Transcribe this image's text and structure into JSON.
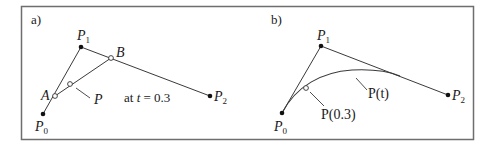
{
  "figure": {
    "frame": {
      "x": 21,
      "y": 6,
      "w": 452,
      "h": 133,
      "stroke": "#6e6e6e"
    },
    "line_color": "#3a3a3a",
    "panels": [
      {
        "id": "a",
        "label": "a)",
        "label_pos": [
          31,
          24
        ],
        "points": {
          "P0": {
            "x": 43,
            "y": 114,
            "label": "P",
            "sub": "0",
            "label_pos": [
              35,
              131
            ],
            "style": "filled"
          },
          "P1": {
            "x": 81,
            "y": 47,
            "label": "P",
            "sub": "1",
            "label_pos": [
              77,
              40
            ],
            "style": "filled"
          },
          "P2": {
            "x": 210,
            "y": 96,
            "label": "P",
            "sub": "2",
            "label_pos": [
              214,
              101
            ],
            "style": "filled"
          },
          "A": {
            "x": 55,
            "y": 96,
            "label": "A",
            "label_pos": [
              41,
              100
            ],
            "style": "open"
          },
          "B": {
            "x": 111,
            "y": 58,
            "label": "B",
            "label_pos": [
              116,
              57
            ],
            "style": "open"
          },
          "P": {
            "x": 70,
            "y": 84,
            "label": "P",
            "label_pos": [
              94,
              104
            ],
            "style": "open"
          }
        },
        "leader_P": [
          [
            76,
            88
          ],
          [
            90,
            98
          ]
        ],
        "annotation": {
          "prefix": "at ",
          "var": "t",
          "suffix": " = 0.3",
          "pos": [
            124,
            102
          ]
        }
      },
      {
        "id": "b",
        "label": "b)",
        "label_pos": [
          271,
          24
        ],
        "points": {
          "P0": {
            "x": 282,
            "y": 113,
            "label": "P",
            "sub": "0",
            "label_pos": [
              274,
              131
            ],
            "style": "filled"
          },
          "P1": {
            "x": 321,
            "y": 46,
            "label": "P",
            "sub": "1",
            "label_pos": [
              317,
              40
            ],
            "style": "filled"
          },
          "P2": {
            "x": 448,
            "y": 95,
            "label": "P",
            "sub": "2",
            "label_pos": [
              452,
              100
            ],
            "style": "filled"
          },
          "P03": {
            "x": 306,
            "y": 88,
            "label": "P(0.3)",
            "label_pos": [
              321,
              119
            ],
            "style": "open"
          }
        },
        "curve_label": {
          "text": "P(t)",
          "pos": [
            368,
            98
          ]
        },
        "leader_P03": [
          [
            310,
            92
          ],
          [
            324,
            106
          ]
        ],
        "leader_Pt": [
          [
            356,
            78
          ],
          [
            367,
            90
          ]
        ]
      }
    ]
  }
}
